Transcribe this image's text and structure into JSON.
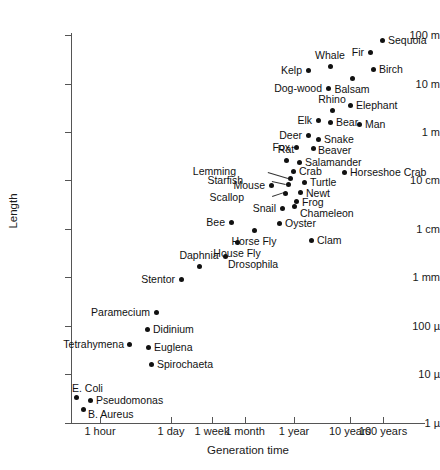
{
  "chart_data": {
    "type": "scatter",
    "title": "",
    "xlabel": "Generation time",
    "ylabel": "Length",
    "x_scale": "log",
    "y_scale": "log",
    "grid": false,
    "legend": null,
    "xticks": [
      "1 hour",
      "1 day",
      "1 week",
      "1 month",
      "1 year",
      "10 years",
      "100 years"
    ],
    "yticks": [
      "100 m",
      "10 m",
      "1 m",
      "10 cm",
      "1 cm",
      "1 mm",
      "100 µ",
      "10 µ",
      "1 µ"
    ],
    "points": [
      {
        "name": "Sequoia",
        "generation_time": "70 years",
        "length": "80 m"
      },
      {
        "name": "Fir",
        "generation_time": "40 years",
        "length": "40 m"
      },
      {
        "name": "Birch",
        "generation_time": "45 years",
        "length": "15 m"
      },
      {
        "name": "Whale",
        "generation_time": "20 years",
        "length": "18 m"
      },
      {
        "name": "Kelp",
        "generation_time": "10 years",
        "length": "15 m"
      },
      {
        "name": "Balsam",
        "generation_time": "30 years",
        "length": "8 m"
      },
      {
        "name": "Dog-wood",
        "generation_time": "18 years",
        "length": "6 m"
      },
      {
        "name": "Elephant",
        "generation_time": "28 years",
        "length": "4 m"
      },
      {
        "name": "Rhino",
        "generation_time": "20 years",
        "length": "3 m"
      },
      {
        "name": "Elk",
        "generation_time": "12 years",
        "length": "1.8 m"
      },
      {
        "name": "Bear",
        "generation_time": "18 years",
        "length": "1.7 m"
      },
      {
        "name": "Man",
        "generation_time": "35 years",
        "length": "1.6 m"
      },
      {
        "name": "Deer",
        "generation_time": "8 years",
        "length": "1.2 m"
      },
      {
        "name": "Snake",
        "generation_time": "11 years",
        "length": "1 m"
      },
      {
        "name": "Fox",
        "generation_time": "4 years",
        "length": "60 cm"
      },
      {
        "name": "Beaver",
        "generation_time": "7 years",
        "length": "60 cm"
      },
      {
        "name": "Rat",
        "generation_time": "2 years",
        "length": "30 cm"
      },
      {
        "name": "Salamander",
        "generation_time": "3 years",
        "length": "25 cm"
      },
      {
        "name": "Crab",
        "generation_time": "3.5 years",
        "length": "20 cm"
      },
      {
        "name": "Horseshoe Crab",
        "generation_time": "10 years",
        "length": "20 cm"
      },
      {
        "name": "Lemming",
        "generation_time": "3 years",
        "length": "12 cm"
      },
      {
        "name": "Starfish",
        "generation_time": "3.5 years",
        "length": "11 cm"
      },
      {
        "name": "Turtle",
        "generation_time": "6 years",
        "length": "10 cm"
      },
      {
        "name": "Mouse",
        "generation_time": "2 years",
        "length": "8 cm"
      },
      {
        "name": "Newt",
        "generation_time": "4.5 years",
        "length": "7 cm"
      },
      {
        "name": "Scallop",
        "generation_time": "3 years",
        "length": "6 cm"
      },
      {
        "name": "Frog",
        "generation_time": "4 years",
        "length": "5 cm"
      },
      {
        "name": "Snail",
        "generation_time": "3 years",
        "length": "3.5 cm"
      },
      {
        "name": "Chameleon",
        "generation_time": "4 years",
        "length": "3 cm"
      },
      {
        "name": "Bee",
        "generation_time": "1 year",
        "length": "1.5 cm"
      },
      {
        "name": "Oyster",
        "generation_time": "3 years",
        "length": "1.5 cm"
      },
      {
        "name": "Horse Fly",
        "generation_time": "2 years",
        "length": "1.2 cm"
      },
      {
        "name": "Clam",
        "generation_time": "6 years",
        "length": "6 mm"
      },
      {
        "name": "House Fly",
        "generation_time": "1 month",
        "length": "6 mm"
      },
      {
        "name": "Daphnia",
        "generation_time": "10 days",
        "length": "1.5 mm"
      },
      {
        "name": "Drosophila",
        "generation_time": "3 weeks",
        "length": "2 mm"
      },
      {
        "name": "Stentor",
        "generation_time": "1 day",
        "length": "1 mm"
      },
      {
        "name": "Paramecium",
        "generation_time": "10 hours",
        "length": "250 µ"
      },
      {
        "name": "Didinium",
        "generation_time": "8 hours",
        "length": "100 µ"
      },
      {
        "name": "Tetrahymena",
        "generation_time": "3 hours",
        "length": "55 µ"
      },
      {
        "name": "Euglena",
        "generation_time": "8 hours",
        "length": "50 µ"
      },
      {
        "name": "Spirochaeta",
        "generation_time": "9 hours",
        "length": "25 µ"
      },
      {
        "name": "E. Coli",
        "generation_time": "30 minutes",
        "length": "4 µ"
      },
      {
        "name": "Pseudomonas",
        "generation_time": "50 minutes",
        "length": "3.5 µ"
      },
      {
        "name": "B. Aureus",
        "generation_time": "40 minutes",
        "length": "2.5 µ"
      }
    ]
  },
  "axes": {
    "y": {
      "title": "Length",
      "ticks": [
        {
          "label": "100 m",
          "y": 35
        },
        {
          "label": "10 m",
          "y": 84
        },
        {
          "label": "1 m",
          "y": 132
        },
        {
          "label": "10 cm",
          "y": 180
        },
        {
          "label": "1 cm",
          "y": 229
        },
        {
          "label": "1 mm",
          "y": 277
        },
        {
          "label": "100 µ",
          "y": 326
        },
        {
          "label": "10 µ",
          "y": 374
        },
        {
          "label": "1 µ",
          "y": 423
        }
      ]
    },
    "x": {
      "title": "Generation time",
      "ticks": [
        {
          "label": "1 hour",
          "x": 100
        },
        {
          "label": "1 day",
          "x": 171
        },
        {
          "label": "1 week",
          "x": 212
        },
        {
          "label": "1 month",
          "x": 245
        },
        {
          "label": "1 year",
          "x": 294
        },
        {
          "label": "10 years",
          "x": 350
        },
        {
          "label": "100 years",
          "x": 383
        }
      ]
    }
  },
  "marks": [
    {
      "name": "Sequoia",
      "x": 382,
      "y": 40,
      "lx": 388,
      "ly": 40,
      "pos": "right"
    },
    {
      "name": "Fir",
      "x": 370,
      "y": 52,
      "lx": 364,
      "ly": 52,
      "pos": "left"
    },
    {
      "name": "Birch",
      "x": 373,
      "y": 69,
      "lx": 379,
      "ly": 69,
      "pos": "right"
    },
    {
      "name": "Whale",
      "x": 330,
      "y": 66,
      "lx": 330,
      "ly": 61,
      "pos": "above"
    },
    {
      "name": "Kelp",
      "x": 308,
      "y": 70,
      "lx": 302,
      "ly": 70,
      "pos": "left"
    },
    {
      "name": "Balsam",
      "x": 352,
      "y": 78,
      "lx": 352,
      "ly": 84,
      "pos": "below"
    },
    {
      "name": "Dog-wood",
      "x": 328,
      "y": 88,
      "lx": 322,
      "ly": 88,
      "pos": "left"
    },
    {
      "name": "Elephant",
      "x": 350,
      "y": 105,
      "lx": 356,
      "ly": 105,
      "pos": "right"
    },
    {
      "name": "Rhino",
      "x": 332,
      "y": 110,
      "lx": 332,
      "ly": 105,
      "pos": "above"
    },
    {
      "name": "Elk",
      "x": 318,
      "y": 120,
      "lx": 312,
      "ly": 120,
      "pos": "left"
    },
    {
      "name": "Bear",
      "x": 330,
      "y": 122,
      "lx": 336,
      "ly": 122,
      "pos": "right"
    },
    {
      "name": "Man",
      "x": 359,
      "y": 124,
      "lx": 365,
      "ly": 124,
      "pos": "right"
    },
    {
      "name": "Deer",
      "x": 308,
      "y": 135,
      "lx": 302,
      "ly": 135,
      "pos": "left"
    },
    {
      "name": "Snake",
      "x": 318,
      "y": 139,
      "lx": 324,
      "ly": 139,
      "pos": "right"
    },
    {
      "name": "Fox",
      "x": 296,
      "y": 147,
      "lx": 290,
      "ly": 147,
      "pos": "left"
    },
    {
      "name": "Beaver",
      "x": 313,
      "y": 148,
      "lx": 318,
      "ly": 150,
      "pos": "right"
    },
    {
      "name": "Rat",
      "x": 286,
      "y": 160,
      "lx": 286,
      "ly": 155,
      "pos": "above"
    },
    {
      "name": "Salamander",
      "x": 299,
      "y": 162,
      "lx": 305,
      "ly": 162,
      "pos": "right"
    },
    {
      "name": "Crab",
      "x": 293,
      "y": 171,
      "lx": 299,
      "ly": 171,
      "pos": "right"
    },
    {
      "name": "Horseshoe Crab",
      "x": 344,
      "y": 172,
      "lx": 350,
      "ly": 172,
      "pos": "right"
    },
    {
      "name": "Turtle",
      "x": 304,
      "y": 182,
      "lx": 310,
      "ly": 182,
      "pos": "right"
    },
    {
      "name": "Mouse",
      "x": 271,
      "y": 185,
      "lx": 265,
      "ly": 185,
      "pos": "left"
    },
    {
      "name": "Newt",
      "x": 300,
      "y": 192,
      "lx": 306,
      "ly": 193,
      "pos": "right"
    },
    {
      "name": "Frog",
      "x": 296,
      "y": 201,
      "lx": 302,
      "ly": 202,
      "pos": "right"
    },
    {
      "name": "Snail",
      "x": 282,
      "y": 208,
      "lx": 276,
      "ly": 208,
      "pos": "left"
    },
    {
      "name": "Chameleon",
      "x": 294,
      "y": 206,
      "lx": 300,
      "ly": 213,
      "pos": "right"
    },
    {
      "name": "Oyster",
      "x": 279,
      "y": 223,
      "lx": 285,
      "ly": 223,
      "pos": "right"
    },
    {
      "name": "Bee",
      "x": 231,
      "y": 222,
      "lx": 225,
      "ly": 222,
      "pos": "left"
    },
    {
      "name": "Horse Fly",
      "x": 254,
      "y": 230,
      "lx": 254,
      "ly": 236,
      "pos": "below"
    },
    {
      "name": "Clam",
      "x": 311,
      "y": 240,
      "lx": 317,
      "ly": 240,
      "pos": "right"
    },
    {
      "name": "House Fly",
      "x": 237,
      "y": 242,
      "lx": 237,
      "ly": 248,
      "pos": "below"
    },
    {
      "name": "Drosophila",
      "x": 225,
      "y": 256,
      "lx": 228,
      "ly": 264,
      "pos": "right"
    },
    {
      "name": "Daphnia",
      "x": 199,
      "y": 266,
      "lx": 199,
      "ly": 261,
      "pos": "above"
    },
    {
      "name": "Stentor",
      "x": 181,
      "y": 279,
      "lx": 175,
      "ly": 279,
      "pos": "left"
    },
    {
      "name": "Paramecium",
      "x": 156,
      "y": 312,
      "lx": 150,
      "ly": 312,
      "pos": "left"
    },
    {
      "name": "Didinium",
      "x": 147,
      "y": 329,
      "lx": 153,
      "ly": 329,
      "pos": "right"
    },
    {
      "name": "Tetrahymena",
      "x": 129,
      "y": 344,
      "lx": 124,
      "ly": 344,
      "pos": "left"
    },
    {
      "name": "Euglena",
      "x": 148,
      "y": 347,
      "lx": 154,
      "ly": 347,
      "pos": "right"
    },
    {
      "name": "Spirochaeta",
      "x": 151,
      "y": 364,
      "lx": 157,
      "ly": 364,
      "pos": "right"
    },
    {
      "name": "E. Coli",
      "x": 76,
      "y": 397,
      "lx": 72,
      "ly": 388,
      "pos": "right"
    },
    {
      "name": "Pseudomonas",
      "x": 90,
      "y": 400,
      "lx": 96,
      "ly": 400,
      "pos": "right"
    },
    {
      "name": "B. Aureus",
      "x": 83,
      "y": 409,
      "lx": 88,
      "ly": 414,
      "pos": "right"
    },
    {
      "name": "Lemming",
      "x": 290,
      "y": 178,
      "lx": 236,
      "ly": 171,
      "pos": "leader"
    },
    {
      "name": "Starfish",
      "x": 288,
      "y": 184,
      "lx": 243,
      "ly": 180,
      "pos": "leader"
    },
    {
      "name": "Scallop",
      "x": 285,
      "y": 193,
      "lx": 244,
      "ly": 197,
      "pos": "leader"
    }
  ],
  "leaders": [
    {
      "from_x": 268,
      "from_y": 172,
      "to_x": 288,
      "to_y": 178
    },
    {
      "from_x": 272,
      "from_y": 181,
      "to_x": 286,
      "to_y": 184
    },
    {
      "from_x": 272,
      "from_y": 196,
      "to_x": 284,
      "to_y": 192
    }
  ]
}
